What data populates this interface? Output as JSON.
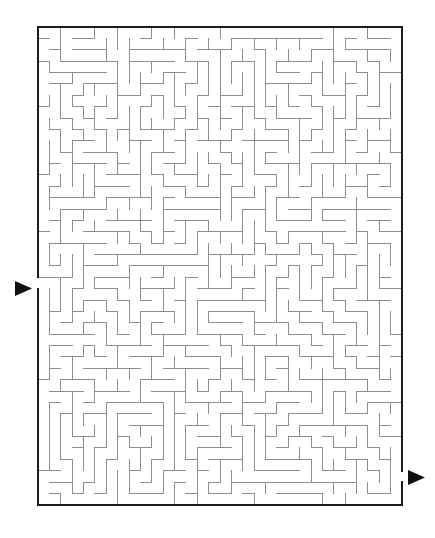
{
  "page": {
    "background_color": "#ffffff",
    "width": 435,
    "height": 538
  },
  "maze": {
    "type": "rectangular-perfect-maze",
    "columns": 32,
    "rows": 42,
    "cell_size_px": 11.375,
    "origin_x_px": 38,
    "origin_y_px": 27,
    "width_px": 364,
    "height_px": 486,
    "wall_color": "#8e8e8e",
    "border_color": "#1b1b1b",
    "wall_thickness_px": 1,
    "border_thickness_px": 2.2,
    "background_color": "#ffffff",
    "entrance": {
      "label": "entrance",
      "side": "left",
      "cell_row": 22,
      "cell_col": 0,
      "gap_y_start_px": 283,
      "gap_y_end_px": 294
    },
    "exit": {
      "label": "exit",
      "side": "right",
      "cell_row": 39,
      "cell_col": 31,
      "gap_y_start_px": 472,
      "gap_y_end_px": 484
    },
    "markers": [
      {
        "name": "entrance-arrow",
        "shape": "right-pointing-triangle",
        "color": "#111111",
        "x_px": 15,
        "y_px": 281,
        "width_px": 17,
        "height_px": 15
      },
      {
        "name": "exit-arrow",
        "shape": "right-pointing-triangle",
        "color": "#111111",
        "x_px": 408,
        "y_px": 470,
        "width_px": 17,
        "height_px": 15
      }
    ]
  },
  "watermark": {
    "text": ""
  }
}
